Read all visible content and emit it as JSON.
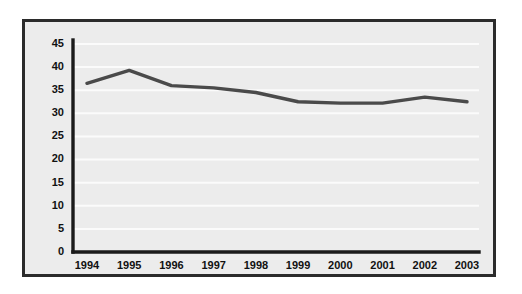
{
  "chart_data": {
    "type": "line",
    "title": "",
    "subtitle": "",
    "xlabel": "",
    "ylabel": "",
    "categories": [
      "1994",
      "1995",
      "1996",
      "1997",
      "1998",
      "1999",
      "2000",
      "2001",
      "2002",
      "2003"
    ],
    "series": [
      {
        "name": "",
        "values": [
          36.5,
          39.3,
          36.0,
          35.5,
          34.5,
          32.5,
          32.2,
          32.2,
          33.5,
          32.5
        ],
        "color": "#4a4a4a"
      }
    ],
    "ylim": [
      0,
      45
    ],
    "ytick_labels": [
      "0",
      "5",
      "10",
      "15",
      "20",
      "25",
      "30",
      "35",
      "40",
      "45"
    ],
    "ytick_values": [
      0,
      5,
      10,
      15,
      20,
      25,
      30,
      35,
      40,
      45
    ],
    "grid": true,
    "grid_orientation": "horizontal",
    "grid_color": "#fbfbfb",
    "legend": null,
    "legend_position": "none",
    "axis_color": "#1a1a1a",
    "plot_background": "#ececec",
    "frame_color": "#2b2b2b",
    "page_background": "#ffffff"
  }
}
